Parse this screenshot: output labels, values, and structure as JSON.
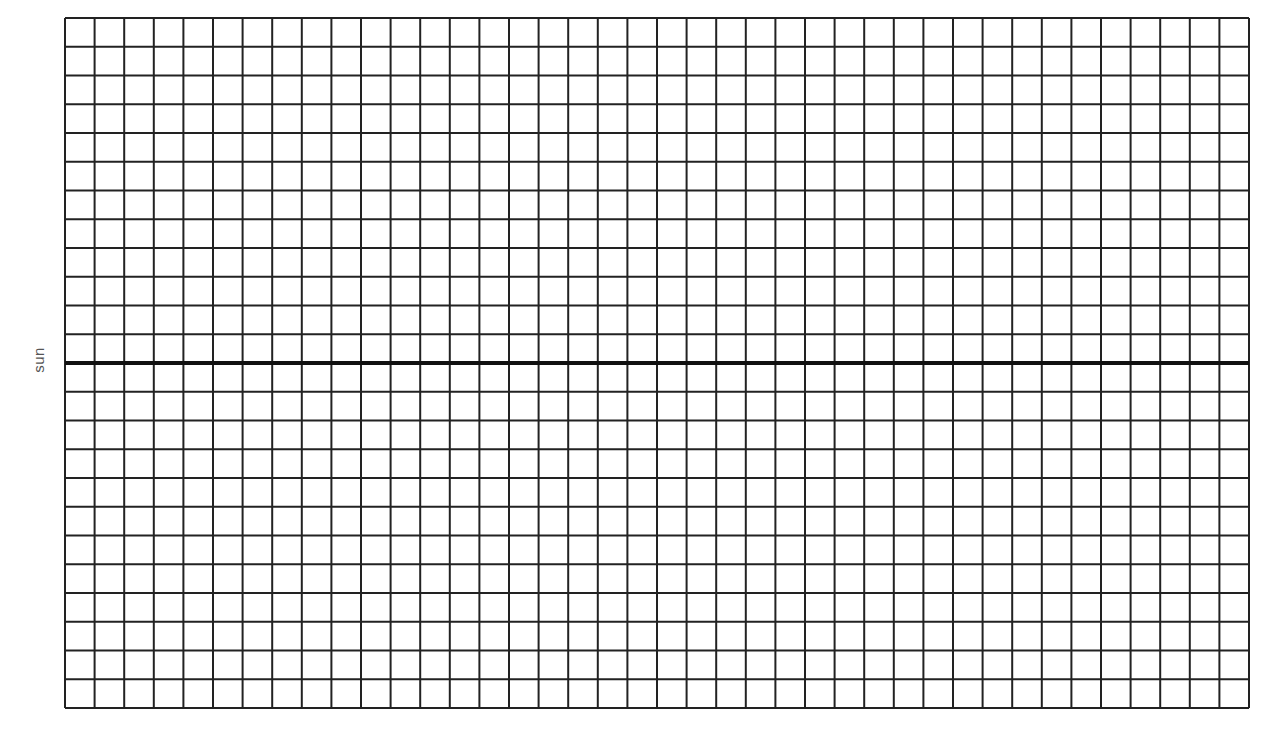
{
  "diagram": {
    "type": "graph-paper",
    "axis_label": "sun",
    "grid": {
      "columns": 40,
      "rows": 24,
      "line_color": "#222222",
      "line_width": 2,
      "background": "#ffffff"
    },
    "reference_line": {
      "orientation": "horizontal",
      "after_row": 12,
      "color": "#111111",
      "width": 4
    }
  }
}
